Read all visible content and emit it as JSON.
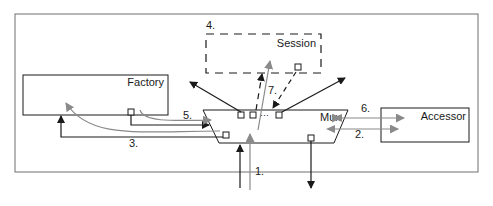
{
  "diagram": {
    "nodes": {
      "session": {
        "label": "Session",
        "step": "4.",
        "style": "dashed"
      },
      "factory": {
        "label": "Factory"
      },
      "mux": {
        "label": "Mux",
        "ports_ellipsis": "···"
      },
      "accessor": {
        "label": "Accessor"
      }
    },
    "edges": [
      {
        "label": "1.",
        "from": "external",
        "to": "mux",
        "color": "gray"
      },
      {
        "label": "2.",
        "from": "mux",
        "to": "accessor",
        "color": "gray",
        "bidirectional": true
      },
      {
        "label": "3.",
        "from": "mux",
        "to": "factory",
        "color": "black"
      },
      {
        "label": "5.",
        "from": "factory",
        "to": "mux",
        "color": "black"
      },
      {
        "label": "6.",
        "from": "mux",
        "to": "accessor",
        "color": "gray",
        "bidirectional": true
      },
      {
        "label": "7.",
        "from": "session",
        "to": "mux",
        "color": "black",
        "style": "dashed"
      }
    ],
    "colors": {
      "line_black": "#1a1a1a",
      "line_gray": "#8a8a8a",
      "frame": "#6e6e6e",
      "background": "#ffffff"
    }
  }
}
